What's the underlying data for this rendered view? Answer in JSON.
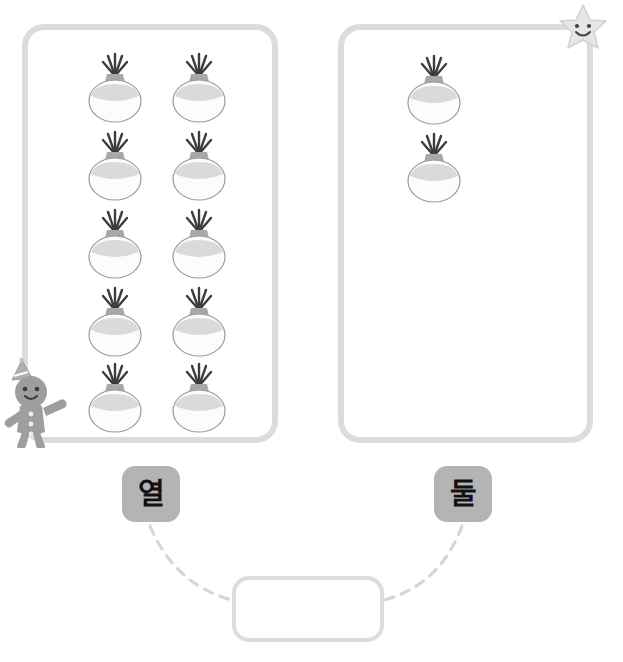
{
  "page": {
    "title": "",
    "background_color": "#ffffff",
    "width": 623,
    "height": 662
  },
  "header_ghost": {
    "left_fragment": "",
    "right_fragment": ""
  },
  "colors": {
    "box_border": "#dcdcdc",
    "chip_background": "#b4b4b4",
    "chip_text": "#111111",
    "connector_line": "#d6d6d6",
    "onion_body": "#fcfcfc",
    "onion_outline": "#9a9a9a",
    "onion_neck": "#a8a8a8",
    "onion_sprout": "#3d3d3d",
    "mascot_gray": "#9e9e9e",
    "star_fill": "#e6e6e6"
  },
  "groups": [
    {
      "name": "left-group",
      "item_label": "onion",
      "count": 10,
      "rows": 5,
      "columns": 2
    },
    {
      "name": "right-group",
      "item_label": "onion",
      "count": 2,
      "rows": 2,
      "columns": 1
    }
  ],
  "word_chips": [
    {
      "id": "chip-left",
      "label": "열",
      "meaning_count": 10
    },
    {
      "id": "chip-right",
      "label": "둘",
      "meaning_count": 2
    }
  ],
  "answer_slot": {
    "value": "",
    "placeholder": ""
  },
  "mascots": [
    {
      "name": "star-mascot",
      "expression": "smiling"
    },
    {
      "name": "gingerbread-mascot",
      "expression": "smiling",
      "accessory": "party-hat"
    }
  ],
  "connectors": [
    {
      "from": "chip-left",
      "to": "answer-slot",
      "style": "dashed"
    },
    {
      "from": "chip-right",
      "to": "answer-slot",
      "style": "dashed"
    }
  ]
}
